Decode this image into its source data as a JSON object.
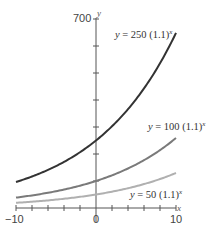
{
  "chart_data": {
    "type": "line",
    "title": "",
    "xlabel": "x",
    "ylabel": "y",
    "xlim": [
      -10,
      10
    ],
    "ylim": [
      0,
      700
    ],
    "x_tick_labels": [
      "-10",
      "0",
      "10"
    ],
    "y_tick_labels": [
      "700"
    ],
    "x_ticks": [
      -10,
      -8,
      -6,
      -4,
      -2,
      0,
      2,
      4,
      6,
      8,
      10
    ],
    "y_ticks": [
      100,
      200,
      300,
      400,
      500,
      600,
      700
    ],
    "grid": false,
    "series": [
      {
        "name": "y = 250 (1.1)^x",
        "a": 250,
        "b": 1.1,
        "color": "#333333",
        "x": [
          -10,
          -5,
          0,
          5,
          10
        ],
        "values": [
          96.4,
          155.2,
          250,
          402.6,
          648.4
        ]
      },
      {
        "name": "y = 100 (1.1)^x",
        "a": 100,
        "b": 1.1,
        "color": "#7a7a7a",
        "x": [
          -10,
          -5,
          0,
          5,
          10
        ],
        "values": [
          38.6,
          62.1,
          100,
          161.1,
          259.4
        ]
      },
      {
        "name": "y = 50 (1.1)^x",
        "a": 50,
        "b": 1.1,
        "color": "#b0b0b0",
        "x": [
          -10,
          -5,
          0,
          5,
          10
        ],
        "values": [
          19.3,
          31.0,
          50,
          80.5,
          129.7
        ]
      }
    ]
  },
  "labels": {
    "y_axis_name": "y",
    "x_axis_name": "x",
    "y_max": "700",
    "x_min": "−10",
    "x_zero": "0",
    "x_max": "10",
    "curve_250_prefix": "y",
    "curve_250_eq": " = 250 (1.1)",
    "curve_100_prefix": "y",
    "curve_100_eq": " = 100 (1.1)",
    "curve_50_prefix": "y",
    "curve_50_eq": " = 50 (1.1)",
    "exponent": "x"
  }
}
